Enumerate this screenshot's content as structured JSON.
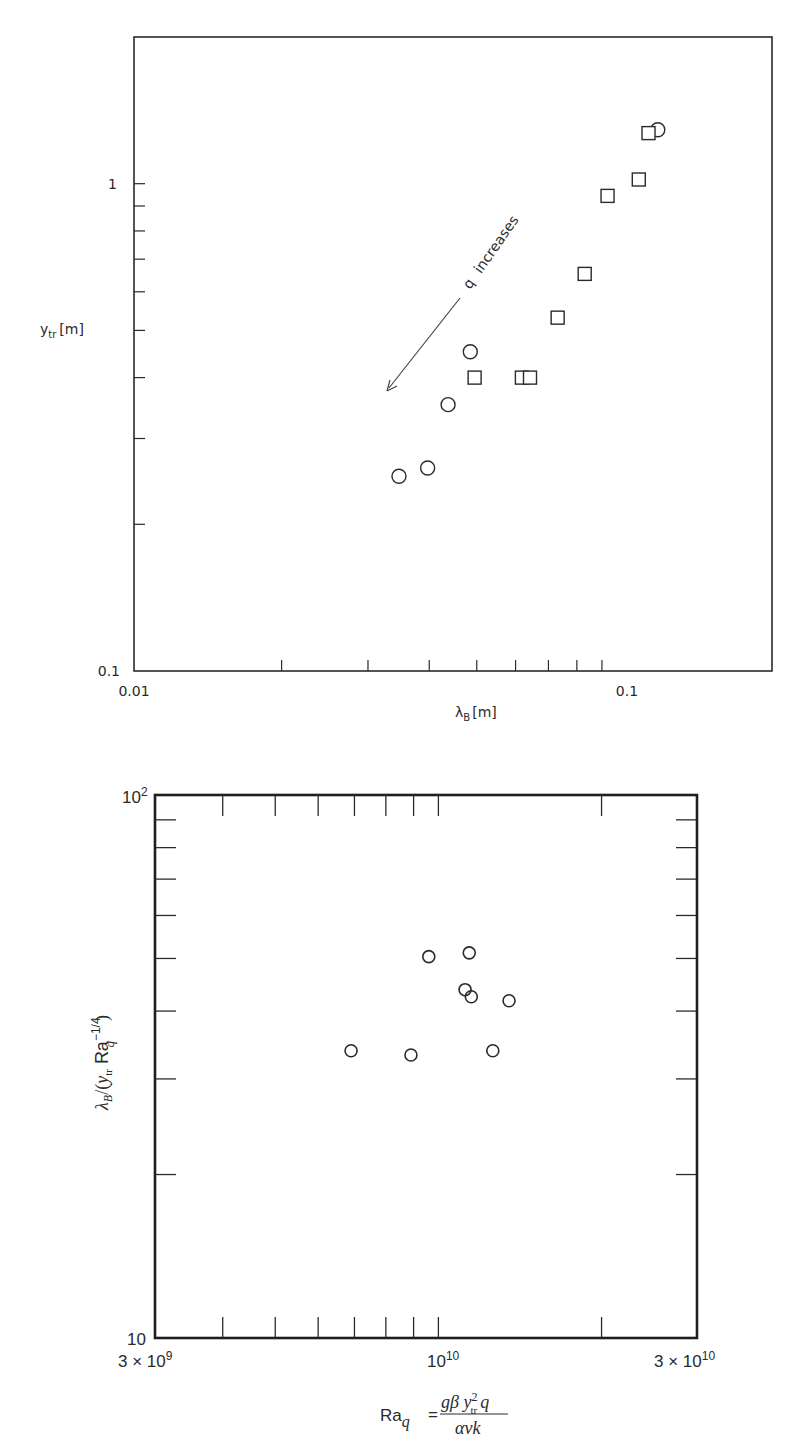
{
  "chart_data": [
    {
      "type": "scatter",
      "title": "",
      "xlabel": "λ_B [m]",
      "ylabel": "y_tr [m]",
      "xscale": "log",
      "yscale": "log",
      "xlim": [
        0.01,
        0.2
      ],
      "ylim": [
        0.1,
        2.0
      ],
      "x_tick_labels": [
        "0.01",
        "0.1"
      ],
      "y_tick_labels": [
        "0.1",
        "1"
      ],
      "x_minor_ticks": [
        0.02,
        0.03,
        0.04,
        0.05,
        0.06,
        0.07,
        0.08,
        0.09
      ],
      "y_minor_ticks": [
        0.2,
        0.3,
        0.4,
        0.5,
        0.6,
        0.7,
        0.8,
        0.9
      ],
      "grid": false,
      "annotation": {
        "text": "q increases",
        "arrow": "points toward lower-left"
      },
      "series": [
        {
          "name": "circles",
          "marker": "circle",
          "points": [
            {
              "x": 0.0347,
              "y": 0.251
            },
            {
              "x": 0.0397,
              "y": 0.261
            },
            {
              "x": 0.0437,
              "y": 0.352
            },
            {
              "x": 0.0485,
              "y": 0.452
            },
            {
              "x": 0.117,
              "y": 1.29
            }
          ]
        },
        {
          "name": "squares",
          "marker": "square",
          "points": [
            {
              "x": 0.0495,
              "y": 0.4
            },
            {
              "x": 0.0618,
              "y": 0.4
            },
            {
              "x": 0.0642,
              "y": 0.4
            },
            {
              "x": 0.0731,
              "y": 0.531
            },
            {
              "x": 0.083,
              "y": 0.653
            },
            {
              "x": 0.0924,
              "y": 0.944
            },
            {
              "x": 0.107,
              "y": 1.02
            },
            {
              "x": 0.112,
              "y": 1.27
            }
          ]
        }
      ]
    },
    {
      "type": "scatter",
      "title": "",
      "xlabel": "Ra_q = gβ y_tr² q / (ανk)",
      "ylabel": "λ_B/(y_tr Ra_q^(−1/4))",
      "xscale": "log",
      "yscale": "log",
      "xlim": [
        3000000000.0,
        30000000000.0
      ],
      "ylim": [
        10,
        100
      ],
      "x_tick_labels": [
        "3 × 10^9",
        "10^10",
        "3 × 10^10"
      ],
      "y_tick_labels": [
        "10",
        "10^2"
      ],
      "x_minor_ticks": [
        4000000000.0,
        5000000000.0,
        6000000000.0,
        7000000000.0,
        8000000000.0,
        9000000000.0,
        10000000000.0,
        20000000000.0
      ],
      "y_minor_ticks": [
        20,
        30,
        40,
        50,
        60,
        70,
        80,
        90
      ],
      "grid": false,
      "series": [
        {
          "name": "circles",
          "marker": "circle",
          "points": [
            {
              "x": 6900000000.0,
              "y": 33.8
            },
            {
              "x": 8900000000.0,
              "y": 33.2
            },
            {
              "x": 9600000000.0,
              "y": 50.4
            },
            {
              "x": 11400000000.0,
              "y": 51.2
            },
            {
              "x": 11200000000.0,
              "y": 43.8
            },
            {
              "x": 11500000000.0,
              "y": 42.5
            },
            {
              "x": 13500000000.0,
              "y": 41.8
            },
            {
              "x": 12600000000.0,
              "y": 33.8
            }
          ]
        }
      ]
    }
  ],
  "top_plot": {
    "x_tick_0": "0.01",
    "x_tick_1": "0.1",
    "y_tick_0": "0.1",
    "y_tick_1": "1",
    "xlabel_main": "λ",
    "xlabel_sub": "B",
    "xlabel_unit": "[m]",
    "ylabel_main": "y",
    "ylabel_sub": "tr",
    "ylabel_unit": "[m]",
    "annotation_q": "q",
    "annotation_text": "increases"
  },
  "bottom_plot": {
    "x_tick_0_base": "3 × 10",
    "x_tick_0_exp": "9",
    "x_tick_1_base": "10",
    "x_tick_1_exp": "10",
    "x_tick_2_base": "3 × 10",
    "x_tick_2_exp": "10",
    "y_tick_0": "10",
    "y_tick_1_base": "10",
    "y_tick_1_exp": "2",
    "xlabel_lhs": "Ra",
    "xlabel_lhs_sub": "q",
    "xlabel_eq": "=",
    "xlabel_num": "gβ y",
    "xlabel_num_sup": "2",
    "xlabel_num_sub": "tr",
    "xlabel_num_q": "q",
    "xlabel_den": "ανk",
    "ylabel": "λ_B/(y_tr Ra_q^−1/4)",
    "ylabel_parts": {
      "lam": "λ",
      "lam_sub": "B",
      "slash": "/(",
      "y": "y",
      "y_sub": "tr",
      "ra": " Ra",
      "ra_sup": "−1/4",
      "ra_sub": "q",
      "close": ")"
    }
  },
  "colors": {
    "ink": "#2a2a2a",
    "background": "#ffffff"
  }
}
